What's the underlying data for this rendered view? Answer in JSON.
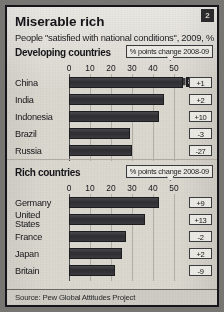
{
  "badge": {
    "label": "2"
  },
  "header": {
    "title": "Miserable rich",
    "subtitle": "People \"satisfied with national conditions\", 2009, %"
  },
  "panels": [
    {
      "heading": "Developing countries",
      "legend": "% points change 2008-09"
    },
    {
      "heading": "Rich countries",
      "legend": "% points change 2008-09"
    }
  ],
  "footer": {
    "source": "Source: Pew Global Attitudes Project"
  },
  "colors": {
    "bar": "#36363a",
    "card_background": "#dbd8d0",
    "border": "#16161a",
    "grid": "#b3afa6"
  },
  "chart_data": [
    {
      "type": "bar",
      "title": "Developing countries",
      "subtitle": "% points change 2008-09",
      "orientation": "horizontal",
      "categories": [
        "China",
        "India",
        "Indonesia",
        "Brazil",
        "Russia"
      ],
      "values": [
        87,
        45,
        43,
        29,
        30
      ],
      "value_labels": [
        "87",
        "",
        "",
        "",
        ""
      ],
      "axis_clipped": [
        true,
        false,
        false,
        false,
        false
      ],
      "annotations": [
        "+1",
        "+2",
        "+10",
        "-3",
        "-27"
      ],
      "xlabel": "",
      "ylabel": "",
      "xticks": [
        0,
        10,
        20,
        30,
        40,
        50
      ],
      "xlim": [
        0,
        55
      ],
      "grid": true,
      "legend": "none"
    },
    {
      "type": "bar",
      "title": "Rich countries",
      "subtitle": "% points change 2008-09",
      "orientation": "horizontal",
      "categories": [
        "Germany",
        "United States",
        "France",
        "Japan",
        "Britain"
      ],
      "values": [
        43,
        36,
        27,
        25,
        22
      ],
      "value_labels": [
        "",
        "",
        "",
        "",
        ""
      ],
      "axis_clipped": [
        false,
        false,
        false,
        false,
        false
      ],
      "annotations": [
        "+9",
        "+13",
        "-2",
        "+2",
        "-9"
      ],
      "xlabel": "",
      "ylabel": "",
      "xticks": [
        0,
        10,
        20,
        30,
        40,
        50
      ],
      "xlim": [
        0,
        55
      ],
      "grid": true,
      "legend": "none"
    }
  ]
}
